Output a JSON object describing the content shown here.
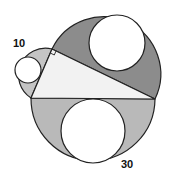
{
  "figure": {
    "type": "geometry",
    "labels": {
      "small_semicircle": "10",
      "large_semicircle": "30"
    },
    "colors": {
      "triangle_fill": "#f2f2f2",
      "upper_region_fill": "#8c8c8c",
      "lower_region_fill": "#b9b9b9",
      "left_region_fill": "#c4c4c4",
      "inner_circle_fill": "#ffffff",
      "stroke": "#222222"
    }
  }
}
